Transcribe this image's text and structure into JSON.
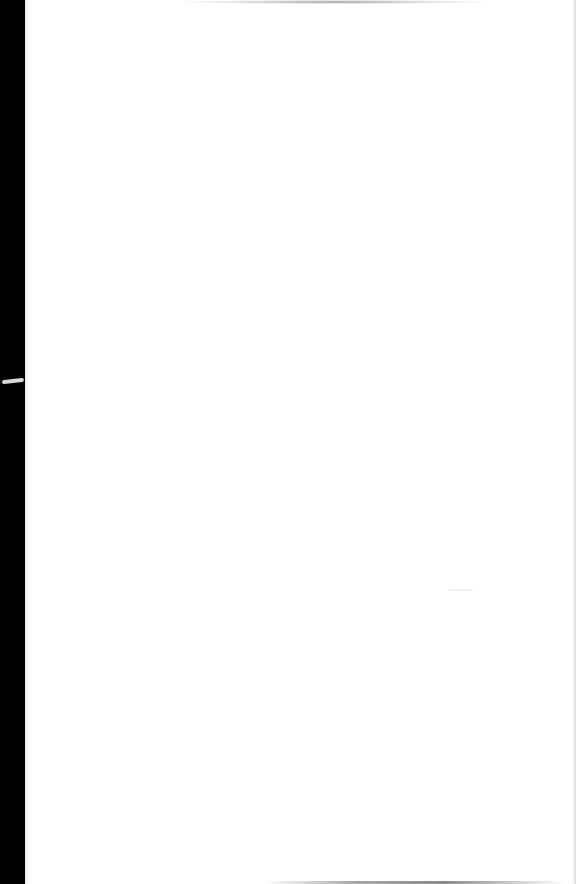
{
  "document": {
    "type": "scanned-page",
    "page_color": "#ffffff",
    "background_color": "#000000",
    "content": []
  }
}
